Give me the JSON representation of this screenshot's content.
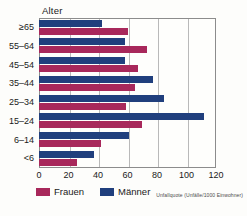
{
  "chart_data": {
    "type": "bar",
    "orientation": "horizontal",
    "title": "",
    "ylabel": "Alter",
    "xlabel": "",
    "xlim": [
      0,
      120
    ],
    "xticks": [
      0,
      20,
      40,
      60,
      80,
      100,
      120
    ],
    "grid": true,
    "legend_position": "bottom-left",
    "categories": [
      "≥65",
      "55–64",
      "45–54",
      "35–44",
      "25–34",
      "15–24",
      "6–14",
      "<6"
    ],
    "series": [
      {
        "name": "Männer",
        "color": "#203f7d",
        "values": [
          43,
          58,
          58,
          77,
          85,
          112,
          61,
          37
        ]
      },
      {
        "name": "Frauen",
        "color": "#a8285b",
        "values": [
          60,
          73,
          67,
          65,
          59,
          70,
          42,
          26
        ]
      }
    ],
    "footnote": "Unfallquote (Unfälle/1000 Einwohner)"
  },
  "axis": {
    "y_title": "Alter",
    "x_tick_labels": [
      "0",
      "20",
      "40",
      "60",
      "80",
      "100",
      "120"
    ],
    "y_tick_labels": [
      "≥65",
      "55–64",
      "45–54",
      "35–44",
      "25–34",
      "15–24",
      "6–14",
      "<6"
    ]
  },
  "legend": {
    "items": [
      {
        "label": "Frauen",
        "color": "#a8285b"
      },
      {
        "label": "Männer",
        "color": "#203f7d"
      }
    ]
  },
  "footnote": {
    "text": "Unfallquote (Unfälle/1000 Einwohner)"
  },
  "colors": {
    "maenner": "#203f7d",
    "frauen": "#a8285b",
    "grid": "#b9b9b9",
    "frame": "#8c8c8c",
    "background": "#fdfdfb"
  }
}
